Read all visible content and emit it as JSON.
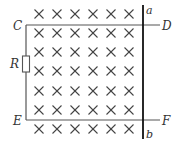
{
  "diagram": {
    "type": "physics-circuit-magnetic-field",
    "labels": {
      "C": "C",
      "D": "D",
      "E": "E",
      "F": "F",
      "a": "a",
      "b": "b",
      "R": "R"
    },
    "field": {
      "symbol": "×",
      "direction": "into-page",
      "columns": [
        39,
        57,
        75,
        93,
        111,
        129
      ],
      "rows": [
        14,
        33,
        52,
        71,
        91,
        110,
        129
      ]
    },
    "colors": {
      "wire": "#444444",
      "rod": "#111111",
      "cross": "#444444",
      "text": "#333333"
    }
  }
}
